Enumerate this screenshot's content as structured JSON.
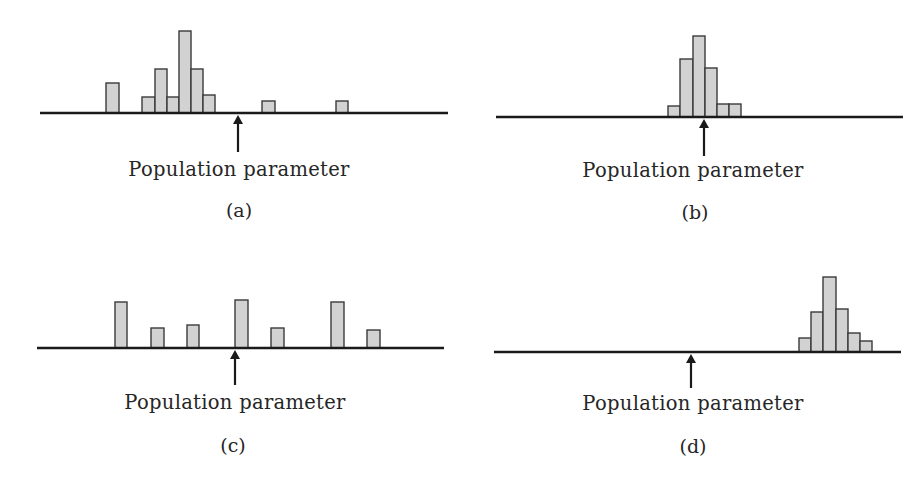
{
  "figure": {
    "panels": [
      {
        "id": "a",
        "caption": "(a)",
        "arrow_label": "Population parameter",
        "axis": {
          "x1": 40,
          "x2": 448,
          "y": 113
        },
        "arrow": {
          "x": 238,
          "y_top": 115,
          "y_bottom": 152
        },
        "label_pos": {
          "x": 239,
          "y": 158
        },
        "caption_pos": {
          "x": 239,
          "y": 199
        },
        "bars": [
          {
            "x": 106,
            "w": 13,
            "h": 30
          },
          {
            "x": 142,
            "w": 13,
            "h": 16
          },
          {
            "x": 155,
            "w": 12,
            "h": 44
          },
          {
            "x": 167,
            "w": 12,
            "h": 16
          },
          {
            "x": 179,
            "w": 12,
            "h": 82
          },
          {
            "x": 191,
            "w": 12,
            "h": 44
          },
          {
            "x": 203,
            "w": 12,
            "h": 18
          },
          {
            "x": 262,
            "w": 13,
            "h": 12
          },
          {
            "x": 336,
            "w": 12,
            "h": 12
          }
        ]
      },
      {
        "id": "b",
        "caption": "(b)",
        "arrow_label": "Population parameter",
        "axis": {
          "x1": 496,
          "x2": 903,
          "y": 117
        },
        "arrow": {
          "x": 704,
          "y_top": 119,
          "y_bottom": 156
        },
        "label_pos": {
          "x": 693,
          "y": 159
        },
        "caption_pos": {
          "x": 695,
          "y": 201
        },
        "bars": [
          {
            "x": 668,
            "w": 12,
            "h": 11
          },
          {
            "x": 680,
            "w": 13,
            "h": 58
          },
          {
            "x": 693,
            "w": 12,
            "h": 81
          },
          {
            "x": 705,
            "w": 12,
            "h": 49
          },
          {
            "x": 717,
            "w": 12,
            "h": 13
          },
          {
            "x": 729,
            "w": 12,
            "h": 13
          }
        ]
      },
      {
        "id": "c",
        "caption": "(c)",
        "arrow_label": "Population parameter",
        "axis": {
          "x1": 37,
          "x2": 444,
          "y": 348
        },
        "arrow": {
          "x": 235,
          "y_top": 350,
          "y_bottom": 385
        },
        "label_pos": {
          "x": 235,
          "y": 391
        },
        "caption_pos": {
          "x": 233,
          "y": 434
        },
        "bars": [
          {
            "x": 115,
            "w": 12,
            "h": 46
          },
          {
            "x": 151,
            "w": 13,
            "h": 20
          },
          {
            "x": 187,
            "w": 12,
            "h": 23
          },
          {
            "x": 235,
            "w": 13,
            "h": 48
          },
          {
            "x": 271,
            "w": 13,
            "h": 20
          },
          {
            "x": 331,
            "w": 13,
            "h": 46
          },
          {
            "x": 367,
            "w": 13,
            "h": 18
          }
        ]
      },
      {
        "id": "d",
        "caption": "(d)",
        "arrow_label": "Population parameter",
        "axis": {
          "x1": 494,
          "x2": 901,
          "y": 352
        },
        "arrow": {
          "x": 691,
          "y_top": 354,
          "y_bottom": 388
        },
        "label_pos": {
          "x": 693,
          "y": 392
        },
        "caption_pos": {
          "x": 693,
          "y": 435
        },
        "bars": [
          {
            "x": 799,
            "w": 12,
            "h": 14
          },
          {
            "x": 811,
            "w": 12,
            "h": 40
          },
          {
            "x": 823,
            "w": 13,
            "h": 75
          },
          {
            "x": 836,
            "w": 12,
            "h": 43
          },
          {
            "x": 848,
            "w": 12,
            "h": 19
          },
          {
            "x": 860,
            "w": 12,
            "h": 11
          }
        ]
      }
    ],
    "colors": {
      "bar_fill": "#d2d2d2",
      "bar_stroke": "#3a3a3a",
      "axis": "#1a1a1a",
      "text": "#262626"
    }
  },
  "chart_data": [
    {
      "type": "bar",
      "title": "(a)",
      "annotation": "Population parameter",
      "note": "spread out, centered left of parameter (biased, high variance)",
      "values": [
        30,
        0,
        16,
        44,
        16,
        82,
        44,
        18,
        12,
        12
      ]
    },
    {
      "type": "bar",
      "title": "(b)",
      "annotation": "Population parameter",
      "note": "tightly clustered around parameter (unbiased, low variance)",
      "values": [
        11,
        58,
        81,
        49,
        13,
        13
      ]
    },
    {
      "type": "bar",
      "title": "(c)",
      "annotation": "Population parameter",
      "note": "widely scattered around parameter (unbiased, high variance)",
      "values": [
        46,
        20,
        23,
        48,
        20,
        46,
        18
      ]
    },
    {
      "type": "bar",
      "title": "(d)",
      "annotation": "Population parameter",
      "note": "tightly clustered far right of parameter (biased, low variance)",
      "values": [
        14,
        40,
        75,
        43,
        19,
        11
      ]
    }
  ]
}
